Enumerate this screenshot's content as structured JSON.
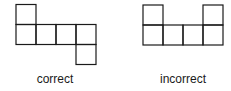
{
  "figures": [
    {
      "id": "correct",
      "label": "correct",
      "cell_size": 20,
      "cells": [
        [
          0,
          0
        ],
        [
          0,
          1
        ],
        [
          1,
          1
        ],
        [
          2,
          1
        ],
        [
          3,
          1
        ],
        [
          3,
          2
        ]
      ]
    },
    {
      "id": "incorrect",
      "label": "incorrect",
      "cell_size": 20,
      "cells": [
        [
          0,
          0
        ],
        [
          3,
          0
        ],
        [
          0,
          1
        ],
        [
          1,
          1
        ],
        [
          2,
          1
        ],
        [
          3,
          1
        ]
      ]
    }
  ],
  "colors": {
    "stroke": "#1a1a1a",
    "background": "#ffffff"
  }
}
